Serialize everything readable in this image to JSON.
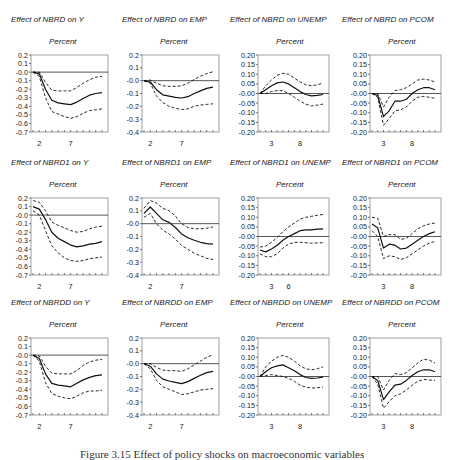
{
  "caption": "Figure 3.15 Effect of policy shocks on macroeconomic variables",
  "chart_data": [
    {
      "type": "line",
      "title": "Effect of NBRD on Y",
      "subtitle": "Percent",
      "ylim": [
        -0.7,
        0.2
      ],
      "yticks": [
        "0.2",
        "0.1",
        "-0.0",
        "-0.1",
        "-0.2",
        "-0.3",
        "-0.4",
        "-0.5",
        "-0.6",
        "-0.7"
      ],
      "xticklabels": {
        "2": "2",
        "7": "7"
      },
      "periods": 12,
      "series": [
        {
          "name": "response",
          "style": "solid",
          "values": [
            0,
            -0.02,
            -0.2,
            -0.33,
            -0.36,
            -0.37,
            -0.38,
            -0.35,
            -0.31,
            -0.27,
            -0.25,
            -0.24
          ]
        },
        {
          "name": "upper",
          "style": "dashed",
          "values": [
            0,
            0.0,
            -0.12,
            -0.21,
            -0.22,
            -0.22,
            -0.22,
            -0.18,
            -0.13,
            -0.09,
            -0.06,
            -0.05
          ]
        },
        {
          "name": "lower",
          "style": "dashed",
          "values": [
            0,
            -0.05,
            -0.3,
            -0.46,
            -0.49,
            -0.52,
            -0.54,
            -0.52,
            -0.48,
            -0.45,
            -0.44,
            -0.43
          ]
        }
      ]
    },
    {
      "type": "line",
      "title": "Effect of NBRD on EMP",
      "subtitle": "Percent",
      "ylim": [
        -0.4,
        0.2
      ],
      "yticks": [
        "0.2",
        "0.1",
        "-0.0",
        "-0.1",
        "-0.2",
        "-0.3",
        "-0.4"
      ],
      "xticklabels": {
        "2": "2",
        "7": "7"
      },
      "periods": 12,
      "series": [
        {
          "name": "response",
          "style": "solid",
          "values": [
            0,
            -0.01,
            -0.07,
            -0.11,
            -0.12,
            -0.13,
            -0.135,
            -0.125,
            -0.1,
            -0.08,
            -0.06,
            -0.05
          ]
        },
        {
          "name": "upper",
          "style": "dashed",
          "values": [
            0,
            0.005,
            -0.02,
            -0.04,
            -0.045,
            -0.045,
            -0.04,
            -0.02,
            0.01,
            0.035,
            0.055,
            0.07
          ]
        },
        {
          "name": "lower",
          "style": "dashed",
          "values": [
            0,
            -0.02,
            -0.12,
            -0.17,
            -0.2,
            -0.215,
            -0.225,
            -0.22,
            -0.2,
            -0.19,
            -0.185,
            -0.18
          ]
        }
      ]
    },
    {
      "type": "line",
      "title": "Effect of NBRD on UNEMP",
      "subtitle": "Percent",
      "ylim": [
        -0.2,
        0.2
      ],
      "yticks": [
        "0.20",
        "0.15",
        "0.10",
        "0.05",
        "-0.00",
        "-0.05",
        "-0.10",
        "-0.15",
        "-0.20"
      ],
      "xticklabels": {
        "3": "3",
        "8": "8"
      },
      "periods": 12,
      "series": [
        {
          "name": "response",
          "style": "solid",
          "values": [
            0,
            0.02,
            0.04,
            0.055,
            0.06,
            0.05,
            0.03,
            0.01,
            -0.005,
            -0.012,
            -0.01,
            -0.005
          ]
        },
        {
          "name": "upper",
          "style": "dashed",
          "values": [
            0,
            0.04,
            0.07,
            0.095,
            0.105,
            0.1,
            0.08,
            0.06,
            0.045,
            0.04,
            0.045,
            0.055
          ]
        },
        {
          "name": "lower",
          "style": "dashed",
          "values": [
            0,
            0.0,
            0.01,
            0.015,
            0.015,
            0.0,
            -0.02,
            -0.04,
            -0.055,
            -0.065,
            -0.06,
            -0.055
          ]
        }
      ]
    },
    {
      "type": "line",
      "title": "Effect of NBRD on PCOM",
      "subtitle": "Percent",
      "ylim": [
        -0.2,
        0.2
      ],
      "yticks": [
        "0.20",
        "0.15",
        "0.10",
        "0.05",
        "-0.00",
        "-0.05",
        "-0.10",
        "-0.15",
        "-0.20"
      ],
      "xticklabels": {
        "3": "3",
        "8": "8"
      },
      "periods": 12,
      "series": [
        {
          "name": "response",
          "style": "solid",
          "values": [
            0,
            -0.01,
            -0.12,
            -0.09,
            -0.04,
            -0.04,
            -0.03,
            0.0,
            0.02,
            0.03,
            0.03,
            0.02
          ]
        },
        {
          "name": "upper",
          "style": "dashed",
          "values": [
            0,
            0.0,
            -0.07,
            -0.02,
            0.015,
            0.02,
            0.03,
            0.05,
            0.07,
            0.075,
            0.07,
            0.06
          ]
        },
        {
          "name": "lower",
          "style": "dashed",
          "values": [
            0,
            -0.02,
            -0.165,
            -0.13,
            -0.09,
            -0.085,
            -0.07,
            -0.04,
            -0.02,
            -0.015,
            -0.02,
            -0.025
          ]
        }
      ]
    },
    {
      "type": "line",
      "title": "Effect of NBRD1 on Y",
      "subtitle": "Percent",
      "ylim": [
        -0.7,
        0.2
      ],
      "yticks": [
        "0.2",
        "0.1",
        "-0.0",
        "-0.1",
        "-0.2",
        "-0.3",
        "-0.4",
        "-0.5",
        "-0.6",
        "-0.7"
      ],
      "xticklabels": {
        "2": "2",
        "7": "7"
      },
      "periods": 12,
      "series": [
        {
          "name": "response",
          "style": "solid",
          "values": [
            0.1,
            0.07,
            -0.05,
            -0.2,
            -0.27,
            -0.31,
            -0.35,
            -0.37,
            -0.36,
            -0.34,
            -0.33,
            -0.31
          ]
        },
        {
          "name": "upper",
          "style": "dashed",
          "values": [
            0.17,
            0.15,
            0.05,
            -0.08,
            -0.12,
            -0.15,
            -0.18,
            -0.2,
            -0.19,
            -0.16,
            -0.14,
            -0.13
          ]
        },
        {
          "name": "lower",
          "style": "dashed",
          "values": [
            0.05,
            0.0,
            -0.18,
            -0.36,
            -0.44,
            -0.5,
            -0.53,
            -0.54,
            -0.53,
            -0.51,
            -0.5,
            -0.49
          ]
        }
      ]
    },
    {
      "type": "line",
      "title": "Effect of NBRD1 on EMP",
      "subtitle": "Percent",
      "ylim": [
        -0.4,
        0.2
      ],
      "yticks": [
        "0.2",
        "0.1",
        "-0.0",
        "-0.1",
        "-0.2",
        "-0.3",
        "-0.4"
      ],
      "xticklabels": {
        "2": "2",
        "7": "7"
      },
      "periods": 12,
      "series": [
        {
          "name": "response",
          "style": "solid",
          "values": [
            0.08,
            0.13,
            0.08,
            0.03,
            0.01,
            -0.03,
            -0.08,
            -0.11,
            -0.13,
            -0.145,
            -0.155,
            -0.16
          ]
        },
        {
          "name": "upper",
          "style": "dashed",
          "values": [
            0.12,
            0.18,
            0.16,
            0.12,
            0.1,
            0.06,
            0.0,
            -0.03,
            -0.04,
            -0.04,
            -0.035,
            -0.025
          ]
        },
        {
          "name": "lower",
          "style": "dashed",
          "values": [
            0.05,
            0.08,
            0.0,
            -0.05,
            -0.08,
            -0.12,
            -0.17,
            -0.2,
            -0.23,
            -0.25,
            -0.27,
            -0.28
          ]
        }
      ]
    },
    {
      "type": "line",
      "title": "Effect of NBRD1 on UNEMP",
      "subtitle": "Percent",
      "ylim": [
        -0.2,
        0.2
      ],
      "yticks": [
        "0.20",
        "0.15",
        "0.10",
        "0.05",
        "-0.00",
        "-0.05",
        "-0.10",
        "-0.15",
        "-0.20"
      ],
      "xticklabels": {
        "3": "3",
        "6": "6"
      },
      "periods": 12,
      "series": [
        {
          "name": "response",
          "style": "solid",
          "values": [
            -0.07,
            -0.08,
            -0.065,
            -0.045,
            -0.02,
            0.0,
            0.015,
            0.03,
            0.035,
            0.035,
            0.038,
            0.04
          ]
        },
        {
          "name": "upper",
          "style": "dashed",
          "values": [
            -0.055,
            -0.05,
            -0.03,
            -0.005,
            0.025,
            0.05,
            0.07,
            0.09,
            0.1,
            0.105,
            0.11,
            0.115
          ]
        },
        {
          "name": "lower",
          "style": "dashed",
          "values": [
            -0.09,
            -0.105,
            -0.105,
            -0.09,
            -0.06,
            -0.04,
            -0.03,
            -0.03,
            -0.032,
            -0.035,
            -0.033,
            -0.032
          ]
        }
      ]
    },
    {
      "type": "line",
      "title": "Effect of NBRD1 on PCOM",
      "subtitle": "Percent",
      "ylim": [
        -0.2,
        0.2
      ],
      "yticks": [
        "0.20",
        "0.15",
        "0.10",
        "0.05",
        "-0.00",
        "-0.05",
        "-0.10",
        "-0.15",
        "-0.20"
      ],
      "xticklabels": {
        "3": "3",
        "8": "8"
      },
      "periods": 12,
      "series": [
        {
          "name": "response",
          "style": "solid",
          "values": [
            0.065,
            0.045,
            -0.06,
            -0.04,
            -0.045,
            -0.065,
            -0.06,
            -0.04,
            -0.02,
            0.0,
            0.015,
            0.025
          ]
        },
        {
          "name": "upper",
          "style": "dashed",
          "values": [
            0.1,
            0.095,
            0.0,
            0.01,
            0.01,
            -0.015,
            -0.01,
            0.015,
            0.04,
            0.055,
            0.065,
            0.07
          ]
        },
        {
          "name": "lower",
          "style": "dashed",
          "values": [
            0.03,
            0.0,
            -0.115,
            -0.1,
            -0.105,
            -0.12,
            -0.11,
            -0.09,
            -0.07,
            -0.05,
            -0.035,
            -0.025
          ]
        }
      ]
    },
    {
      "type": "line",
      "title": "Effect of NBRDD on Y",
      "subtitle": "Percent",
      "ylim": [
        -0.7,
        0.2
      ],
      "yticks": [
        "0.2",
        "0.1",
        "-0.0",
        "-0.1",
        "-0.2",
        "-0.3",
        "-0.4",
        "-0.5",
        "-0.6",
        "-0.7"
      ],
      "xticklabels": {
        "2": "2",
        "7": "7"
      },
      "periods": 12,
      "series": [
        {
          "name": "response",
          "style": "solid",
          "values": [
            0,
            -0.04,
            -0.22,
            -0.33,
            -0.35,
            -0.36,
            -0.37,
            -0.33,
            -0.29,
            -0.26,
            -0.24,
            -0.23
          ]
        },
        {
          "name": "upper",
          "style": "dashed",
          "values": [
            0,
            -0.01,
            -0.13,
            -0.21,
            -0.22,
            -0.22,
            -0.22,
            -0.18,
            -0.12,
            -0.08,
            -0.06,
            -0.05
          ]
        },
        {
          "name": "lower",
          "style": "dashed",
          "values": [
            0,
            -0.07,
            -0.32,
            -0.45,
            -0.48,
            -0.5,
            -0.51,
            -0.48,
            -0.44,
            -0.42,
            -0.42,
            -0.41
          ]
        }
      ]
    },
    {
      "type": "line",
      "title": "Effect of NBRDD on EMP",
      "subtitle": "Percent",
      "ylim": [
        -0.4,
        0.2
      ],
      "yticks": [
        "0.2",
        "0.1",
        "-0.0",
        "-0.1",
        "-0.2",
        "-0.3",
        "-0.4"
      ],
      "xticklabels": {
        "2": "2",
        "7": "7"
      },
      "periods": 12,
      "series": [
        {
          "name": "response",
          "style": "solid",
          "values": [
            0,
            -0.02,
            -0.08,
            -0.12,
            -0.135,
            -0.145,
            -0.155,
            -0.14,
            -0.115,
            -0.09,
            -0.07,
            -0.06
          ]
        },
        {
          "name": "upper",
          "style": "dashed",
          "values": [
            0,
            0.0,
            -0.03,
            -0.05,
            -0.055,
            -0.055,
            -0.06,
            -0.04,
            -0.01,
            0.02,
            0.05,
            0.07
          ]
        },
        {
          "name": "lower",
          "style": "dashed",
          "values": [
            0,
            -0.04,
            -0.13,
            -0.18,
            -0.2,
            -0.22,
            -0.24,
            -0.235,
            -0.22,
            -0.205,
            -0.2,
            -0.195
          ]
        }
      ]
    },
    {
      "type": "line",
      "title": "Effect of NBRDD on UNEMP",
      "subtitle": "Percent",
      "ylim": [
        -0.2,
        0.2
      ],
      "yticks": [
        "0.20",
        "0.15",
        "0.10",
        "0.05",
        "-0.00",
        "-0.05",
        "-0.10",
        "-0.15",
        "-0.20"
      ],
      "xticklabels": {
        "3": "3",
        "8": "8"
      },
      "periods": 12,
      "series": [
        {
          "name": "response",
          "style": "solid",
          "values": [
            0,
            0.025,
            0.045,
            0.055,
            0.06,
            0.045,
            0.03,
            0.01,
            -0.005,
            -0.01,
            -0.008,
            -0.003
          ]
        },
        {
          "name": "upper",
          "style": "dashed",
          "values": [
            0,
            0.05,
            0.08,
            0.1,
            0.11,
            0.1,
            0.08,
            0.055,
            0.04,
            0.035,
            0.04,
            0.05
          ]
        },
        {
          "name": "lower",
          "style": "dashed",
          "values": [
            0,
            0.005,
            0.01,
            0.005,
            0.0,
            -0.01,
            -0.025,
            -0.045,
            -0.055,
            -0.06,
            -0.058,
            -0.055
          ]
        }
      ]
    },
    {
      "type": "line",
      "title": "Effect of NBRDD on PCOM",
      "subtitle": "Percent",
      "ylim": [
        -0.2,
        0.2
      ],
      "yticks": [
        "0.20",
        "0.15",
        "0.10",
        "0.05",
        "-0.00",
        "-0.05",
        "-0.10",
        "-0.15",
        "-0.20"
      ],
      "xticklabels": {
        "3": "3",
        "8": "8"
      },
      "periods": 12,
      "series": [
        {
          "name": "response",
          "style": "solid",
          "values": [
            0,
            -0.02,
            -0.12,
            -0.08,
            -0.045,
            -0.04,
            -0.02,
            0.005,
            0.025,
            0.035,
            0.035,
            0.025
          ]
        },
        {
          "name": "upper",
          "style": "dashed",
          "values": [
            0,
            0.0,
            -0.07,
            -0.02,
            0.015,
            0.01,
            0.02,
            0.045,
            0.07,
            0.09,
            0.085,
            0.07
          ]
        },
        {
          "name": "lower",
          "style": "dashed",
          "values": [
            0,
            -0.04,
            -0.165,
            -0.13,
            -0.1,
            -0.09,
            -0.07,
            -0.045,
            -0.025,
            -0.015,
            -0.018,
            -0.02
          ]
        }
      ]
    }
  ],
  "layout": {
    "cols_x": [
      31,
      142,
      258,
      370
    ],
    "frame_w": [
      77,
      77,
      71,
      71
    ],
    "rows_y": [
      55,
      198,
      338
    ],
    "frame_h": 77
  }
}
